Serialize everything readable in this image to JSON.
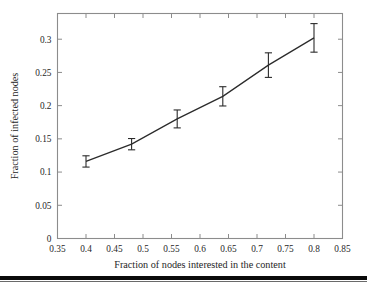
{
  "figure": {
    "background_color": "#ffffff",
    "axis_color": "#8c8c8c",
    "line_color": "#2b2b2b",
    "text_color": "#262626",
    "rule_color": "#0a0a0a"
  },
  "chart_data": {
    "type": "line",
    "title": "",
    "xlabel": "Fraction of nodes interested in the content",
    "ylabel": "Fraction of infected nodes",
    "xlim": [
      0.35,
      0.85
    ],
    "ylim": [
      0,
      0.3387
    ],
    "xticks": [
      0.35,
      0.4,
      0.45,
      0.5,
      0.55,
      0.6,
      0.65,
      0.7,
      0.75,
      0.8,
      0.85
    ],
    "xtick_labels": [
      "0.35",
      "0.4",
      "0.45",
      "0.5",
      "0.55",
      "0.6",
      "0.65",
      "0.7",
      "0.75",
      "0.8",
      "0.85"
    ],
    "yticks": [
      0,
      0.05,
      0.1,
      0.15,
      0.2,
      0.25,
      0.3
    ],
    "ytick_labels": [
      "0",
      "0.05",
      "0.1",
      "0.15",
      "0.2",
      "0.25",
      "0.3"
    ],
    "grid": false,
    "legend": null,
    "series": [
      {
        "name": "Fraction of infected nodes",
        "marker": "none",
        "errorbars": true,
        "x": [
          0.4,
          0.48,
          0.56,
          0.64,
          0.72,
          0.8
        ],
        "values": [
          0.116,
          0.142,
          0.18,
          0.214,
          0.261,
          0.302
        ],
        "yerr_low": [
          0.0085,
          0.0085,
          0.0135,
          0.0145,
          0.0185,
          0.0215
        ],
        "yerr_high": [
          0.0085,
          0.0085,
          0.0135,
          0.0145,
          0.0185,
          0.0215
        ]
      }
    ]
  }
}
